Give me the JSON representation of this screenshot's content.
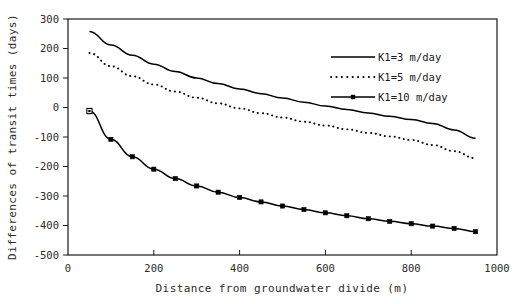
{
  "chart_data": {
    "type": "line",
    "title": "",
    "xlabel": "Distance from groundwater divide (m)",
    "ylabel": "Differences of transit times (days)",
    "xlim": [
      0,
      1000
    ],
    "ylim": [
      -500,
      300
    ],
    "xticks": [
      0,
      200,
      400,
      600,
      800,
      1000
    ],
    "yticks": [
      -500,
      -400,
      -300,
      -200,
      -100,
      0,
      100,
      200,
      300
    ],
    "xtick_labels": [
      "0",
      "200",
      "400",
      "600",
      "800",
      "1000"
    ],
    "ytick_labels": [
      "-500",
      "-400",
      "-300",
      "-200",
      "-100",
      "0",
      "100",
      "200",
      "300"
    ],
    "grid": false,
    "legend_position": "upper right",
    "series": [
      {
        "name": "K1=3 m/day",
        "style": "solid",
        "markers": false,
        "color": "#000000",
        "x": [
          50,
          100,
          150,
          200,
          250,
          300,
          350,
          400,
          450,
          500,
          550,
          600,
          650,
          700,
          750,
          800,
          850,
          900,
          950
        ],
        "y": [
          258,
          212,
          177,
          147,
          122,
          100,
          81,
          63,
          47,
          32,
          18,
          5,
          -7,
          -19,
          -30,
          -41,
          -54,
          -76,
          -104
        ]
      },
      {
        "name": "K1=5 m/day",
        "style": "dotted",
        "markers": false,
        "color": "#000000",
        "x": [
          50,
          100,
          150,
          200,
          250,
          300,
          350,
          400,
          450,
          500,
          550,
          600,
          650,
          700,
          750,
          800,
          850,
          900,
          950
        ],
        "y": [
          185,
          140,
          106,
          78,
          54,
          33,
          14,
          -3,
          -19,
          -34,
          -48,
          -61,
          -74,
          -86,
          -98,
          -110,
          -127,
          -148,
          -172
        ]
      },
      {
        "name": "K1=10 m/day",
        "style": "solid",
        "markers": true,
        "color": "#000000",
        "x": [
          50,
          100,
          150,
          200,
          250,
          300,
          350,
          400,
          450,
          500,
          550,
          600,
          650,
          700,
          750,
          800,
          850,
          900,
          950
        ],
        "y": [
          -12,
          -108,
          -167,
          -209,
          -241,
          -266,
          -287,
          -305,
          -320,
          -334,
          -346,
          -357,
          -367,
          -377,
          -386,
          -394,
          -402,
          -410,
          -421
        ]
      }
    ]
  },
  "legend": {
    "entries": [
      {
        "label": "K1=3 m/day"
      },
      {
        "label": "K1=5 m/day"
      },
      {
        "label": "K1=10 m/day"
      }
    ]
  }
}
